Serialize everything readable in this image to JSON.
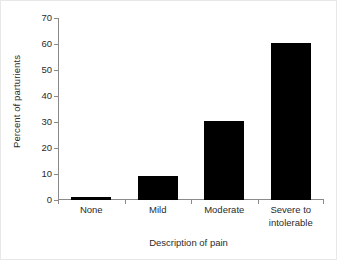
{
  "chart_data": {
    "type": "bar",
    "title": "",
    "categories": [
      "None",
      "Mild",
      "Moderate",
      "Severe to\nintolerable"
    ],
    "values": [
      1.3,
      9.2,
      30.4,
      60.4
    ],
    "xlabel": "Description of pain",
    "ylabel": "Percent of parturients",
    "ylim": [
      0,
      70
    ],
    "ytick_values": [
      0,
      10,
      20,
      30,
      40,
      50,
      60,
      70
    ],
    "ytick_labels": [
      "0",
      "10",
      "20",
      "30",
      "40",
      "50",
      "60",
      "70"
    ],
    "grid": false,
    "legend": false,
    "bar_color": "#000000",
    "axis_color": "#8a8a8a",
    "text_color": "#2b2b2b",
    "background": "#ffffff"
  }
}
